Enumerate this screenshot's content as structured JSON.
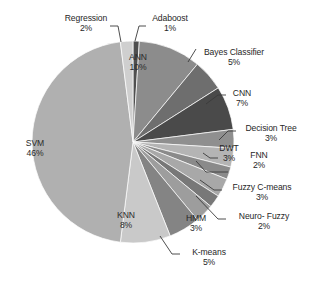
{
  "chart_data": {
    "type": "pie",
    "title": "",
    "subtitle": "",
    "xlabel": "",
    "ylabel": "",
    "legend_position": "none",
    "grid": false,
    "value_suffix": "%",
    "total": 100,
    "categories": [
      "Adaboost",
      "ANN",
      "Bayes Classifier",
      "CNN",
      "Decision Tree",
      "DWT",
      "FNN",
      "Fuzzy C-means",
      "Neuro- Fuzzy",
      "HMM",
      "K-means",
      "KNN",
      "SVM",
      "Regression"
    ],
    "values": [
      1,
      10,
      5,
      7,
      3,
      3,
      2,
      3,
      2,
      3,
      5,
      8,
      46,
      2
    ],
    "slices": [
      {
        "label": "Adaboost",
        "value": 1,
        "pct_text": "1%",
        "color": "#4f4f4f",
        "label_placement": "outside"
      },
      {
        "label": "ANN",
        "value": 10,
        "pct_text": "10%",
        "color": "#8c8c8c",
        "label_placement": "inside"
      },
      {
        "label": "Bayes Classifier",
        "value": 5,
        "pct_text": "5%",
        "color": "#6e6e6e",
        "label_placement": "outside"
      },
      {
        "label": "CNN",
        "value": 7,
        "pct_text": "7%",
        "color": "#4a4a4a",
        "label_placement": "outside"
      },
      {
        "label": "Decision Tree",
        "value": 3,
        "pct_text": "3%",
        "color": "#8f8f8f",
        "label_placement": "outside"
      },
      {
        "label": "DWT",
        "value": 3,
        "pct_text": "3%",
        "color": "#b4b4b4",
        "label_placement": "outside"
      },
      {
        "label": "FNN",
        "value": 2,
        "pct_text": "2%",
        "color": "#8a8a8a",
        "label_placement": "outside"
      },
      {
        "label": "Fuzzy C-means",
        "value": 3,
        "pct_text": "3%",
        "color": "#a8a8a8",
        "label_placement": "outside"
      },
      {
        "label": "Neuro- Fuzzy",
        "value": 2,
        "pct_text": "2%",
        "color": "#787878",
        "label_placement": "outside"
      },
      {
        "label": "HMM",
        "value": 3,
        "pct_text": "3%",
        "color": "#9d9d9d",
        "label_placement": "outside"
      },
      {
        "label": "K-means",
        "value": 5,
        "pct_text": "5%",
        "color": "#848484",
        "label_placement": "outside"
      },
      {
        "label": "KNN",
        "value": 8,
        "pct_text": "8%",
        "color": "#c9c9c9",
        "label_placement": "inside"
      },
      {
        "label": "SVM",
        "value": 46,
        "pct_text": "46%",
        "color": "#b0b0b0",
        "label_placement": "inside"
      },
      {
        "label": "Regression",
        "value": 2,
        "pct_text": "2%",
        "color": "#cfcfcf",
        "label_placement": "outside"
      }
    ],
    "geometry": {
      "cx": 133,
      "cy": 142,
      "r": 101,
      "start_angle_deg": -90
    },
    "colors": {
      "background": "#ffffff",
      "slice_border": "#ffffff",
      "text": "#272727",
      "leader_line": "#3a3a3a"
    }
  },
  "labels": {
    "regression": {
      "name": "Regression",
      "pct": "2%"
    },
    "adaboost": {
      "name": "Adaboost",
      "pct": "1%"
    },
    "ann": {
      "name": "ANN",
      "pct": "10%"
    },
    "bayes": {
      "name": "Bayes Classifier",
      "pct": "5%"
    },
    "cnn": {
      "name": "CNN",
      "pct": "7%"
    },
    "decision_tree": {
      "name": "Decision Tree",
      "pct": "3%"
    },
    "dwt": {
      "name": "DWT",
      "pct": "3%"
    },
    "fnn": {
      "name": "FNN",
      "pct": "2%"
    },
    "fuzzy_cmeans": {
      "name": "Fuzzy C-means",
      "pct": "3%"
    },
    "neuro_fuzzy": {
      "name": "Neuro- Fuzzy",
      "pct": "2%"
    },
    "hmm": {
      "name": "HMM",
      "pct": "3%"
    },
    "kmeans": {
      "name": "K-means",
      "pct": "5%"
    },
    "knn": {
      "name": "KNN",
      "pct": "8%"
    },
    "svm": {
      "name": "SVM",
      "pct": "46%"
    }
  }
}
